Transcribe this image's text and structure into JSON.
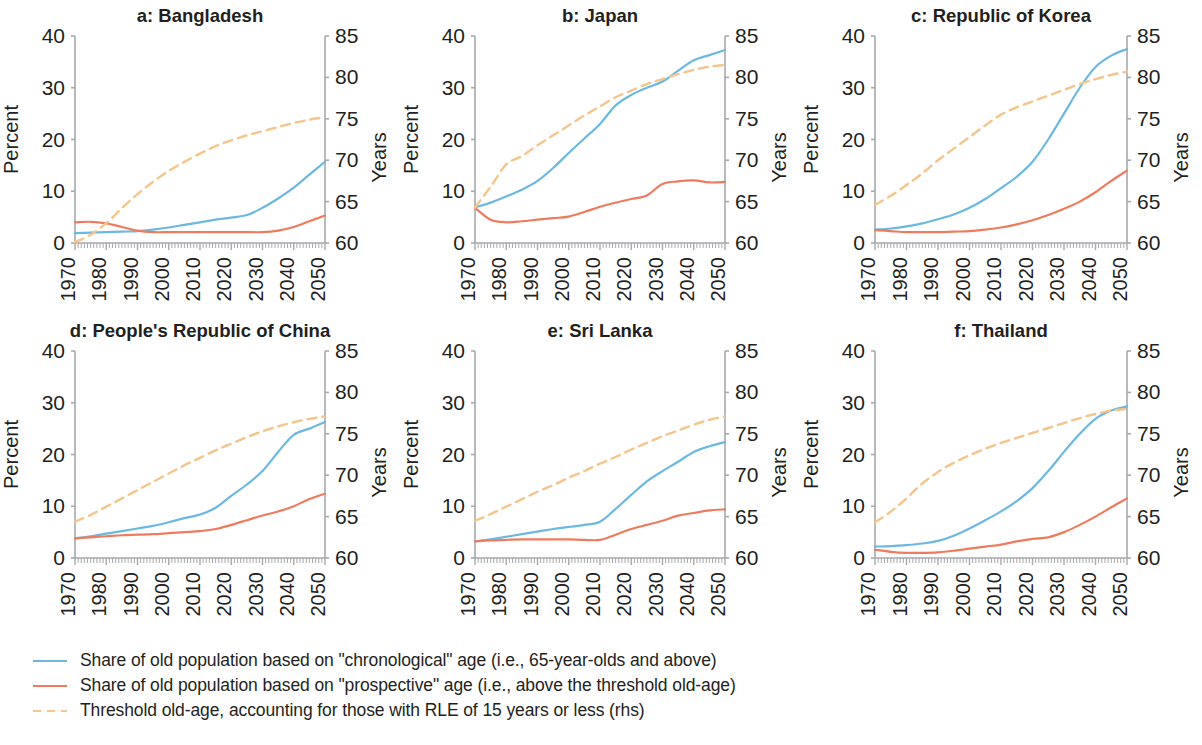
{
  "figure": {
    "panel_count": 6,
    "x_tick_labels": [
      "1970",
      "1980",
      "1990",
      "2000",
      "2010",
      "2020",
      "2030",
      "2040",
      "2050"
    ],
    "left_axis_title": "Percent",
    "right_axis_title": "Years",
    "left_tick_labels": [
      "0",
      "10",
      "20",
      "30",
      "40"
    ],
    "right_tick_labels": [
      "60",
      "65",
      "70",
      "75",
      "80",
      "85"
    ]
  },
  "colors": {
    "chronological": "#6cb8e0",
    "prospective": "#ef7b5e",
    "threshold": "#f4c58c",
    "axis": "#a7a9ac",
    "text": "#231f20",
    "background": "#ffffff"
  },
  "legend": {
    "items": [
      {
        "style": "solid",
        "color_key": "chronological",
        "label": "Share of old population based on \"chronological\" age (i.e., 65-year-olds and above)"
      },
      {
        "style": "solid",
        "color_key": "prospective",
        "label": "Share of old population based on \"prospective\" age (i.e., above the threshold old-age)"
      },
      {
        "style": "dashed",
        "color_key": "threshold",
        "label": "Threshold old-age, accounting for those with RLE of 15 years or less (rhs)"
      }
    ]
  },
  "chart_data": [
    {
      "type": "line",
      "title": "a: Bangladesh",
      "xlabel": "",
      "ylabel": "Percent",
      "y2label": "Years",
      "xlim": [
        1970,
        2050
      ],
      "ylim": [
        0,
        40
      ],
      "y2lim": [
        60,
        85
      ],
      "yticks": [
        0,
        10,
        20,
        30,
        40
      ],
      "y2ticks": [
        60,
        65,
        70,
        75,
        80,
        85
      ],
      "xticks": [
        1970,
        1980,
        1990,
        2000,
        2010,
        2020,
        2030,
        2040,
        2050
      ],
      "grid": false,
      "legend_position": "below-figure",
      "x": [
        1970,
        1975,
        1980,
        1985,
        1990,
        1995,
        2000,
        2005,
        2010,
        2015,
        2020,
        2025,
        2030,
        2035,
        2040,
        2045,
        2050
      ],
      "series": [
        {
          "name": "Share of old population based on \"chronological\" age",
          "axis": "left",
          "style": "solid",
          "color_key": "chronological",
          "values": [
            1.9,
            2.0,
            2.1,
            2.2,
            2.3,
            2.6,
            3.0,
            3.5,
            4.0,
            4.5,
            4.9,
            5.4,
            6.8,
            8.6,
            10.7,
            13.2,
            15.7
          ]
        },
        {
          "name": "Share of old population based on \"prospective\" age",
          "axis": "left",
          "style": "solid",
          "color_key": "prospective",
          "values": [
            4.0,
            4.1,
            3.8,
            3.1,
            2.4,
            2.1,
            2.1,
            2.1,
            2.1,
            2.1,
            2.1,
            2.1,
            2.1,
            2.4,
            3.1,
            4.2,
            5.3
          ]
        },
        {
          "name": "Threshold old-age, accounting for those with RLE of 15 years or less",
          "axis": "right",
          "style": "dashed",
          "color_key": "threshold",
          "values": [
            60.1,
            61.0,
            62.4,
            64.2,
            65.9,
            67.4,
            68.7,
            69.8,
            70.8,
            71.7,
            72.4,
            73.0,
            73.5,
            74.0,
            74.5,
            74.9,
            75.2
          ]
        }
      ]
    },
    {
      "type": "line",
      "title": "b: Japan",
      "xlabel": "",
      "ylabel": "Percent",
      "y2label": "Years",
      "xlim": [
        1970,
        2050
      ],
      "ylim": [
        0,
        40
      ],
      "y2lim": [
        60,
        85
      ],
      "yticks": [
        0,
        10,
        20,
        30,
        40
      ],
      "y2ticks": [
        60,
        65,
        70,
        75,
        80,
        85
      ],
      "xticks": [
        1970,
        1980,
        1990,
        2000,
        2010,
        2020,
        2030,
        2040,
        2050
      ],
      "grid": false,
      "legend_position": "below-figure",
      "x": [
        1970,
        1975,
        1980,
        1985,
        1990,
        1995,
        2000,
        2005,
        2010,
        2015,
        2020,
        2025,
        2030,
        2035,
        2040,
        2045,
        2050
      ],
      "series": [
        {
          "name": "Share of old population based on \"chronological\" age",
          "axis": "left",
          "style": "solid",
          "color_key": "chronological",
          "values": [
            6.9,
            7.8,
            9.0,
            10.3,
            12.0,
            14.5,
            17.4,
            20.2,
            23.0,
            26.6,
            28.6,
            30.0,
            31.2,
            33.3,
            35.3,
            36.3,
            37.3
          ]
        },
        {
          "name": "Share of old population based on \"prospective\" age",
          "axis": "left",
          "style": "solid",
          "color_key": "prospective",
          "values": [
            6.8,
            4.5,
            4.0,
            4.2,
            4.5,
            4.8,
            5.1,
            6.0,
            7.0,
            7.8,
            8.5,
            9.2,
            11.4,
            11.9,
            12.1,
            11.7,
            11.8
          ]
        },
        {
          "name": "Threshold old-age, accounting for those with RLE of 15 years or less",
          "axis": "right",
          "style": "dashed",
          "color_key": "threshold",
          "values": [
            64.3,
            66.8,
            69.5,
            70.5,
            71.8,
            73.0,
            74.2,
            75.4,
            76.5,
            77.6,
            78.4,
            79.2,
            79.8,
            80.4,
            80.9,
            81.3,
            81.5
          ]
        }
      ]
    },
    {
      "type": "line",
      "title": "c: Republic of Korea",
      "xlabel": "",
      "ylabel": "Percent",
      "y2label": "Years",
      "xlim": [
        1970,
        2050
      ],
      "ylim": [
        0,
        40
      ],
      "y2lim": [
        60,
        85
      ],
      "yticks": [
        0,
        10,
        20,
        30,
        40
      ],
      "y2ticks": [
        60,
        65,
        70,
        75,
        80,
        85
      ],
      "xticks": [
        1970,
        1980,
        1990,
        2000,
        2010,
        2020,
        2030,
        2040,
        2050
      ],
      "grid": false,
      "legend_position": "below-figure",
      "x": [
        1970,
        1975,
        1980,
        1985,
        1990,
        1995,
        2000,
        2005,
        2010,
        2015,
        2020,
        2025,
        2030,
        2035,
        2040,
        2045,
        2050
      ],
      "series": [
        {
          "name": "Share of old population based on \"chronological\" age",
          "axis": "left",
          "style": "solid",
          "color_key": "chronological",
          "values": [
            2.6,
            2.8,
            3.2,
            3.8,
            4.6,
            5.5,
            6.8,
            8.5,
            10.6,
            12.8,
            15.7,
            20.0,
            25.0,
            30.0,
            34.0,
            36.2,
            37.5
          ]
        },
        {
          "name": "Share of old population based on \"prospective\" age",
          "axis": "left",
          "style": "solid",
          "color_key": "prospective",
          "values": [
            2.5,
            2.3,
            2.1,
            2.1,
            2.1,
            2.2,
            2.3,
            2.6,
            3.0,
            3.6,
            4.4,
            5.4,
            6.6,
            8.0,
            9.8,
            12.0,
            14.0
          ]
        },
        {
          "name": "Threshold old-age, accounting for those with RLE of 15 years or less",
          "axis": "right",
          "style": "dashed",
          "color_key": "threshold",
          "values": [
            64.6,
            65.7,
            67.0,
            68.4,
            70.0,
            71.4,
            72.8,
            74.2,
            75.5,
            76.4,
            77.1,
            77.8,
            78.5,
            79.2,
            79.8,
            80.3,
            80.7
          ]
        }
      ]
    },
    {
      "type": "line",
      "title": "d: People's Republic of China",
      "xlabel": "",
      "ylabel": "Percent",
      "y2label": "Years",
      "xlim": [
        1970,
        2050
      ],
      "ylim": [
        0,
        40
      ],
      "y2lim": [
        60,
        85
      ],
      "yticks": [
        0,
        10,
        20,
        30,
        40
      ],
      "y2ticks": [
        60,
        65,
        70,
        75,
        80,
        85
      ],
      "xticks": [
        1970,
        1980,
        1990,
        2000,
        2010,
        2020,
        2030,
        2040,
        2050
      ],
      "grid": false,
      "legend_position": "below-figure",
      "x": [
        1970,
        1975,
        1980,
        1985,
        1990,
        1995,
        2000,
        2005,
        2010,
        2015,
        2020,
        2025,
        2030,
        2035,
        2040,
        2045,
        2050
      ],
      "series": [
        {
          "name": "Share of old population based on \"chronological\" age",
          "axis": "left",
          "style": "solid",
          "color_key": "chronological",
          "values": [
            3.8,
            4.2,
            4.7,
            5.2,
            5.7,
            6.2,
            6.9,
            7.7,
            8.4,
            9.7,
            12.0,
            14.2,
            16.8,
            20.5,
            23.8,
            25.0,
            26.3
          ]
        },
        {
          "name": "Share of old population based on \"prospective\" age",
          "axis": "left",
          "style": "solid",
          "color_key": "prospective",
          "values": [
            3.8,
            4.0,
            4.2,
            4.4,
            4.5,
            4.6,
            4.8,
            5.0,
            5.2,
            5.6,
            6.4,
            7.3,
            8.2,
            9.0,
            10.0,
            11.4,
            12.4
          ]
        },
        {
          "name": "Threshold old-age, accounting for those with RLE of 15 years or less",
          "axis": "right",
          "style": "dashed",
          "color_key": "threshold",
          "values": [
            64.4,
            65.2,
            66.2,
            67.2,
            68.2,
            69.2,
            70.2,
            71.2,
            72.1,
            73.0,
            73.8,
            74.6,
            75.3,
            75.9,
            76.4,
            76.8,
            77.1
          ]
        }
      ]
    },
    {
      "type": "line",
      "title": "e: Sri Lanka",
      "xlabel": "",
      "ylabel": "Percent",
      "y2label": "Years",
      "xlim": [
        1970,
        2050
      ],
      "ylim": [
        0,
        40
      ],
      "y2lim": [
        60,
        85
      ],
      "yticks": [
        0,
        10,
        20,
        30,
        40
      ],
      "y2ticks": [
        60,
        65,
        70,
        75,
        80,
        85
      ],
      "xticks": [
        1970,
        1980,
        1990,
        2000,
        2010,
        2020,
        2030,
        2040,
        2050
      ],
      "grid": false,
      "legend_position": "below-figure",
      "x": [
        1970,
        1975,
        1980,
        1985,
        1990,
        1995,
        2000,
        2005,
        2010,
        2015,
        2020,
        2025,
        2030,
        2035,
        2040,
        2045,
        2050
      ],
      "series": [
        {
          "name": "Share of old population based on \"chronological\" age",
          "axis": "left",
          "style": "solid",
          "color_key": "chronological",
          "values": [
            3.2,
            3.6,
            4.1,
            4.6,
            5.1,
            5.6,
            6.0,
            6.4,
            7.0,
            9.5,
            12.2,
            14.8,
            16.8,
            18.6,
            20.5,
            21.6,
            22.4
          ]
        },
        {
          "name": "Share of old population based on \"prospective\" age",
          "axis": "left",
          "style": "solid",
          "color_key": "prospective",
          "values": [
            3.2,
            3.4,
            3.5,
            3.6,
            3.6,
            3.6,
            3.6,
            3.5,
            3.5,
            4.5,
            5.6,
            6.4,
            7.2,
            8.2,
            8.7,
            9.2,
            9.4
          ]
        },
        {
          "name": "Threshold old-age, accounting for those with RLE of 15 years or less",
          "axis": "right",
          "style": "dashed",
          "color_key": "threshold",
          "values": [
            64.5,
            65.3,
            66.2,
            67.1,
            68.0,
            68.8,
            69.7,
            70.5,
            71.4,
            72.2,
            73.1,
            73.9,
            74.7,
            75.4,
            76.1,
            76.7,
            77.1
          ]
        }
      ]
    },
    {
      "type": "line",
      "title": "f: Thailand",
      "xlabel": "",
      "ylabel": "Percent",
      "y2label": "Years",
      "xlim": [
        1970,
        2050
      ],
      "ylim": [
        0,
        40
      ],
      "y2lim": [
        60,
        85
      ],
      "yticks": [
        0,
        10,
        20,
        30,
        40
      ],
      "y2ticks": [
        60,
        65,
        70,
        75,
        80,
        85
      ],
      "xticks": [
        1970,
        1980,
        1990,
        2000,
        2010,
        2020,
        2030,
        2040,
        2050
      ],
      "grid": false,
      "legend_position": "below-figure",
      "x": [
        1970,
        1975,
        1980,
        1985,
        1990,
        1995,
        2000,
        2005,
        2010,
        2015,
        2020,
        2025,
        2030,
        2035,
        2040,
        2045,
        2050
      ],
      "series": [
        {
          "name": "Share of old population based on \"chronological\" age",
          "axis": "left",
          "style": "solid",
          "color_key": "chronological",
          "values": [
            2.2,
            2.3,
            2.5,
            2.8,
            3.3,
            4.3,
            5.7,
            7.3,
            9.0,
            11.0,
            13.5,
            16.8,
            20.5,
            24.0,
            26.9,
            28.5,
            29.3
          ]
        },
        {
          "name": "Share of old population based on \"prospective\" age",
          "axis": "left",
          "style": "solid",
          "color_key": "prospective",
          "values": [
            1.6,
            1.2,
            1.0,
            1.0,
            1.1,
            1.4,
            1.8,
            2.2,
            2.6,
            3.2,
            3.7,
            4.0,
            5.0,
            6.4,
            8.0,
            9.8,
            11.5
          ]
        },
        {
          "name": "Threshold old-age, accounting for those with RLE of 15 years or less",
          "axis": "right",
          "style": "dashed",
          "color_key": "threshold",
          "values": [
            64.3,
            65.6,
            67.2,
            69.0,
            70.4,
            71.5,
            72.4,
            73.2,
            73.9,
            74.5,
            75.1,
            75.7,
            76.3,
            76.9,
            77.4,
            77.8,
            78.0
          ]
        }
      ]
    }
  ]
}
